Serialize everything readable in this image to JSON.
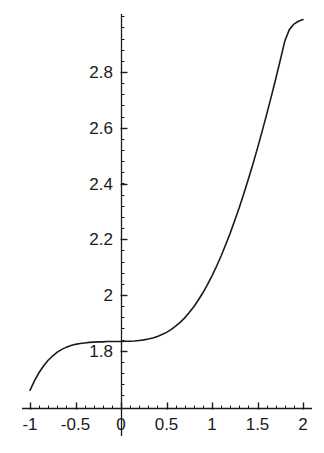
{
  "chart_data": {
    "type": "line",
    "title": "",
    "xlabel": "",
    "ylabel": "",
    "xlim": [
      -1,
      2
    ],
    "ylim": [
      1.62,
      3.0
    ],
    "grid": false,
    "legend": null,
    "axis_style": "crossed-spines-at-origin",
    "x_ticks": [
      {
        "value": -1,
        "label": "-1"
      },
      {
        "value": -0.5,
        "label": "-0.5"
      },
      {
        "value": 0,
        "label": "0"
      },
      {
        "value": 0.5,
        "label": "0.5"
      },
      {
        "value": 1,
        "label": "1"
      },
      {
        "value": 1.5,
        "label": "1.5"
      },
      {
        "value": 2,
        "label": "2"
      }
    ],
    "y_ticks": [
      {
        "value": 1.8,
        "label": "1.8"
      },
      {
        "value": 2.0,
        "label": "2"
      },
      {
        "value": 2.2,
        "label": "2.2"
      },
      {
        "value": 2.4,
        "label": "2.4"
      },
      {
        "value": 2.6,
        "label": "2.6"
      },
      {
        "value": 2.8,
        "label": "2.8"
      }
    ],
    "x_minor_tick_step": 0.1,
    "y_minor_tick_step": 0.04,
    "series": [
      {
        "name": "curve",
        "color": "#1a1a1a",
        "x": [
          -1.0,
          -0.95,
          -0.9,
          -0.85,
          -0.8,
          -0.75,
          -0.7,
          -0.65,
          -0.6,
          -0.55,
          -0.5,
          -0.45,
          -0.4,
          -0.35,
          -0.3,
          -0.25,
          -0.2,
          -0.15,
          -0.1,
          -0.05,
          0.0,
          0.05,
          0.1,
          0.15,
          0.2,
          0.25,
          0.3,
          0.35,
          0.4,
          0.45,
          0.5,
          0.55,
          0.6,
          0.65,
          0.7,
          0.75,
          0.8,
          0.85,
          0.9,
          0.95,
          1.0,
          1.05,
          1.1,
          1.15,
          1.2,
          1.25,
          1.3,
          1.35,
          1.4,
          1.45,
          1.5,
          1.55,
          1.6,
          1.65,
          1.7,
          1.75,
          1.8,
          1.85,
          1.9,
          1.95,
          2.0
        ],
        "y": [
          1.658,
          1.693,
          1.722,
          1.746,
          1.766,
          1.782,
          1.795,
          1.805,
          1.813,
          1.819,
          1.823,
          1.826,
          1.828,
          1.83,
          1.831,
          1.832,
          1.832,
          1.833,
          1.833,
          1.833,
          1.833,
          1.834,
          1.834,
          1.835,
          1.837,
          1.839,
          1.842,
          1.846,
          1.851,
          1.858,
          1.866,
          1.876,
          1.888,
          1.902,
          1.918,
          1.937,
          1.958,
          1.982,
          2.008,
          2.037,
          2.069,
          2.103,
          2.14,
          2.18,
          2.222,
          2.267,
          2.314,
          2.364,
          2.416,
          2.47,
          2.527,
          2.586,
          2.647,
          2.71,
          2.775,
          2.842,
          2.911,
          2.952,
          2.972,
          2.982,
          2.988
        ]
      }
    ]
  },
  "axes_geometry": {
    "x_of_zero_px": 121,
    "y_of_two_px": 295,
    "px_per_x_unit": 91,
    "px_per_y_unit": 278.75
  }
}
